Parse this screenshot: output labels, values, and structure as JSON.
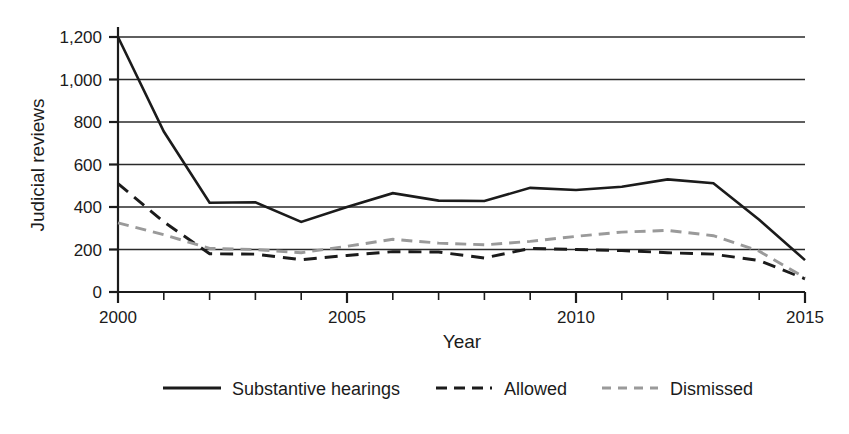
{
  "chart_data": {
    "type": "line",
    "title": "",
    "subtitle": "",
    "xlabel": "Year",
    "ylabel": "Judicial reviews",
    "xlim": [
      2000,
      2015
    ],
    "ylim": [
      0,
      1200
    ],
    "ytick_values": [
      0,
      200,
      400,
      600,
      800,
      1000,
      1200
    ],
    "ytick_labels": [
      "0",
      "200",
      "400",
      "600",
      "800",
      "1,000",
      "1,200"
    ],
    "xtick_values": [
      2000,
      2001,
      2002,
      2003,
      2004,
      2005,
      2006,
      2007,
      2008,
      2009,
      2010,
      2011,
      2012,
      2013,
      2014,
      2015
    ],
    "xtick_labels_shown": [
      "2000",
      "2005",
      "2010",
      "2015"
    ],
    "xtick_labeled_values": [
      2000,
      2005,
      2010,
      2015
    ],
    "grid": "horizontal",
    "legend_position": "bottom",
    "x": [
      2000,
      2001,
      2002,
      2003,
      2004,
      2005,
      2006,
      2007,
      2008,
      2009,
      2010,
      2011,
      2012,
      2013,
      2014,
      2015
    ],
    "series": [
      {
        "name": "Substantive hearings",
        "style": "solid",
        "color": "#1b1b1b",
        "values": [
          1200,
          755,
          420,
          422,
          330,
          400,
          465,
          430,
          428,
          490,
          480,
          495,
          530,
          512,
          340,
          150
        ]
      },
      {
        "name": "Allowed",
        "style": "dashed",
        "color": "#1b1b1b",
        "values": [
          510,
          330,
          180,
          178,
          152,
          172,
          190,
          188,
          160,
          205,
          200,
          195,
          185,
          178,
          148,
          62
        ]
      },
      {
        "name": "Dismissed",
        "style": "dashed",
        "color": "#9a9a9a",
        "values": [
          325,
          270,
          205,
          200,
          185,
          215,
          248,
          230,
          222,
          238,
          262,
          282,
          290,
          265,
          192,
          68
        ]
      }
    ]
  },
  "legend": {
    "items": [
      {
        "label": "Substantive hearings",
        "style": "solid",
        "color": "#1b1b1b"
      },
      {
        "label": "Allowed",
        "style": "dashed",
        "color": "#1b1b1b"
      },
      {
        "label": "Dismissed",
        "style": "dashed",
        "color": "#9a9a9a"
      }
    ]
  }
}
